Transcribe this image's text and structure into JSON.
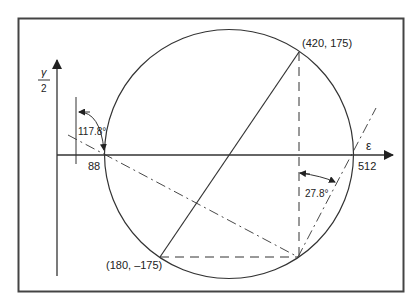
{
  "figure": {
    "axes": {
      "vertical_label_top": "γ",
      "vertical_label_bottom": "2",
      "horizontal_label": "ε"
    },
    "intercepts": {
      "left": "88",
      "right": "512"
    },
    "points": {
      "top": "(420, 175)",
      "bottom": "(180, –175)"
    },
    "angles": {
      "left": "117.8°",
      "right": "27.8°"
    }
  },
  "colors": {
    "line": "#333333",
    "frame": "#444444",
    "background": "#ffffff"
  }
}
